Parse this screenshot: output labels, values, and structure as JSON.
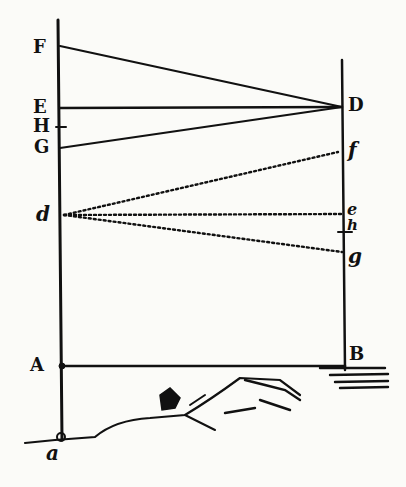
{
  "diagram": {
    "labels": {
      "F": "F",
      "E": "E",
      "H": "H",
      "G": "G",
      "d": "d",
      "D": "D",
      "f": "f",
      "e": "e",
      "h": "h",
      "g": "g",
      "A": "A",
      "B": "B",
      "a": "a"
    },
    "colors": {
      "ink": "#111111",
      "paper": "#fbfbf8"
    }
  }
}
